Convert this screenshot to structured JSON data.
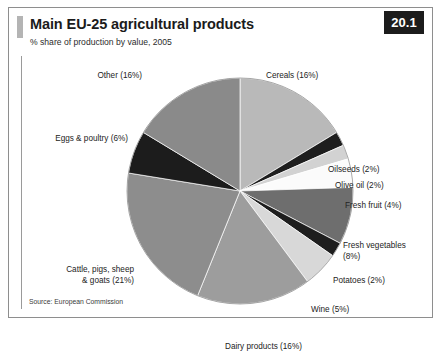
{
  "figure": {
    "number": "20.1",
    "title": "Main EU-25 agricultural products",
    "subtitle": "% share of production by value, 2005",
    "source": "Source: European Commission"
  },
  "chart_data": {
    "type": "pie",
    "title": "Main EU-25 agricultural products",
    "subtitle": "% share of production by value, 2005",
    "xlabel": "",
    "ylabel": "% share of production by value",
    "units": "percent",
    "start_angle_deg": 0,
    "direction": "clockwise",
    "legend": "none (direct labels)",
    "grid": false,
    "categories": [
      "Cereals",
      "Oilseeds",
      "Olive oil",
      "Fresh fruit",
      "Fresh vegetables",
      "Potatoes",
      "Wine",
      "Dairy products",
      "Cattle, pigs, sheep & goats",
      "Eggs & poultry",
      "Other"
    ],
    "values": [
      16,
      2,
      2,
      4,
      8,
      2,
      5,
      16,
      21,
      6,
      16
    ],
    "colors": [
      "#b9b9b9",
      "#1e1e1e",
      "#d2d2d2",
      "#fbfbfb",
      "#6e6e6e",
      "#1e1e1e",
      "#d8d8d8",
      "#9d9d9d",
      "#8d8d8d",
      "#1c1c1c",
      "#8a8a8a"
    ],
    "slices": [
      {
        "label": "Cereals (16%)",
        "name": "Cereals",
        "value": 16,
        "color": "#b9b9b9"
      },
      {
        "label": "Oilseeds (2%)",
        "name": "Oilseeds",
        "value": 2,
        "color": "#1e1e1e"
      },
      {
        "label": "Olive oil (2%)",
        "name": "Olive oil",
        "value": 2,
        "color": "#d2d2d2"
      },
      {
        "label": "Fresh fruit (4%)",
        "name": "Fresh fruit",
        "value": 4,
        "color": "#fbfbfb"
      },
      {
        "label": "Fresh vegetables",
        "label2": "(8%)",
        "name": "Fresh vegetables",
        "value": 8,
        "color": "#6e6e6e"
      },
      {
        "label": "Potatoes (2%)",
        "name": "Potatoes",
        "value": 2,
        "color": "#1e1e1e"
      },
      {
        "label": "Wine (5%)",
        "name": "Wine",
        "value": 5,
        "color": "#d8d8d8"
      },
      {
        "label": "Dairy products (16%)",
        "name": "Dairy products",
        "value": 16,
        "color": "#9d9d9d"
      },
      {
        "label": "Cattle, pigs, sheep",
        "label2": "& goats (21%)",
        "name": "Cattle, pigs, sheep & goats",
        "value": 21,
        "color": "#8d8d8d"
      },
      {
        "label": "Eggs & poultry (6%)",
        "name": "Eggs & poultry",
        "value": 6,
        "color": "#1c1c1c"
      },
      {
        "label": "Other (16%)",
        "name": "Other",
        "value": 16,
        "color": "#8a8a8a"
      }
    ]
  }
}
